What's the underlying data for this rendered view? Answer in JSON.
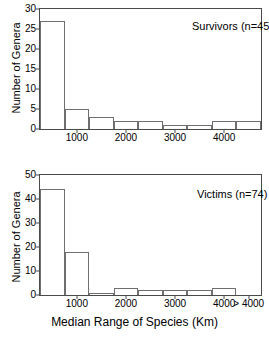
{
  "chart_data": [
    {
      "type": "bar",
      "id": "survivors",
      "title": "Survivors (n=45)",
      "xlabel": "Median Range of Species (Km)",
      "ylabel": "Number of Genera",
      "ylim": [
        0,
        30
      ],
      "yticks": [
        0,
        5,
        10,
        15,
        20,
        25,
        30
      ],
      "ytick_labels": [
        "0",
        "5",
        "10",
        "15",
        "20",
        "25",
        "30"
      ],
      "xlim": [
        250,
        4750
      ],
      "xticks": [
        1000,
        2000,
        3000,
        4000
      ],
      "xtick_labels": [
        "1000",
        "2000",
        "3000",
        "4000"
      ],
      "bin_edges": [
        250,
        750,
        1250,
        1750,
        2250,
        2750,
        3250,
        3750,
        4250,
        4750
      ],
      "categories": [
        "250-750",
        "750-1250",
        "1250-1750",
        "1750-2250",
        "2250-2750",
        "2750-3250",
        "3250-3750",
        "3750-4250",
        "4250-4750"
      ],
      "values": [
        27,
        5,
        3,
        2,
        2,
        1,
        1,
        2,
        2
      ],
      "grid": false,
      "legend": "none"
    },
    {
      "type": "bar",
      "id": "victims",
      "title": "Victims (n=74)",
      "xlabel": "Median Range of Species (Km)",
      "ylabel": "Number of Genera",
      "ylim": [
        0,
        50
      ],
      "yticks": [
        0,
        10,
        20,
        30,
        40,
        50
      ],
      "ytick_labels": [
        "0",
        "10",
        "20",
        "30",
        "40",
        "50"
      ],
      "xlim": [
        250,
        4750
      ],
      "xticks": [
        1000,
        2000,
        3000,
        4000,
        4500
      ],
      "xtick_labels": [
        "1000",
        "2000",
        "3000",
        "4000",
        "> 4000"
      ],
      "bin_edges": [
        250,
        750,
        1250,
        1750,
        2250,
        2750,
        3250,
        3750,
        4250,
        4750
      ],
      "categories": [
        "250-750",
        "750-1250",
        "1250-1750",
        "1750-2250",
        "2250-2750",
        "2750-3250",
        "3250-3750",
        "3750-4250",
        "4250-4750"
      ],
      "values": [
        44,
        18,
        1,
        3,
        2,
        2,
        2,
        3,
        0
      ],
      "grid": false,
      "legend": "none"
    }
  ],
  "figure": {
    "xlabel": "Median Range of Species (Km)",
    "axis_color": "#4a4a4a",
    "bar_edge_color": "#6f6f6f",
    "background": "#ffffff"
  }
}
